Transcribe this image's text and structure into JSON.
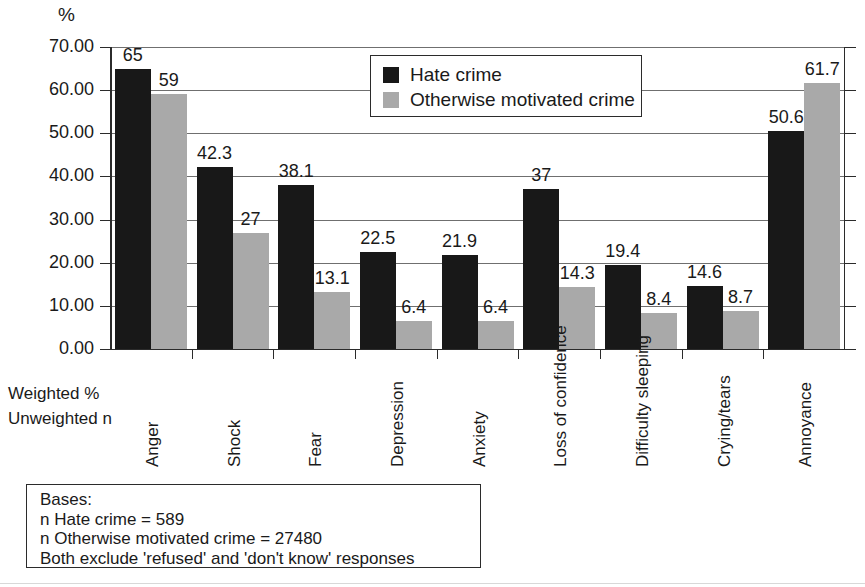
{
  "axis_unit_label": "%",
  "weighted_note": {
    "line1": "Weighted  %",
    "line2": "Unweighted n"
  },
  "legend": {
    "items": [
      {
        "label": "Hate crime",
        "color": "#181818",
        "swatch": "hate"
      },
      {
        "label": "Otherwise motivated crime",
        "color": "#a9a9a9",
        "swatch": "other"
      }
    ]
  },
  "bases": {
    "title": "Bases:",
    "line_hate": "n Hate crime = 589",
    "line_other": "n Otherwise motivated crime = 27480",
    "line_note": "Both exclude 'refused' and 'don't know' responses"
  },
  "chart_data": {
    "type": "bar",
    "title": "",
    "subtitle": "",
    "xlabel": "",
    "ylabel": "%",
    "ylim": [
      0,
      70
    ],
    "ytick_labels": [
      "0.00",
      "10.00",
      "20.00",
      "30.00",
      "40.00",
      "50.00",
      "60.00",
      "70.00"
    ],
    "ytick_values": [
      0,
      10,
      20,
      30,
      40,
      50,
      60,
      70
    ],
    "grid": true,
    "legend_position": "top-center",
    "categories": [
      "Anger",
      "Shock",
      "Fear",
      "Depression",
      "Anxiety",
      "Loss of confidence",
      "Difficulty sleeping",
      "Crying/tears",
      "Annoyance"
    ],
    "series": [
      {
        "name": "Hate crime",
        "color": "#181818",
        "values": [
          65,
          42.3,
          38.1,
          22.5,
          21.9,
          37,
          19.4,
          14.6,
          50.6
        ],
        "labels": [
          "65",
          "42.3",
          "38.1",
          "22.5",
          "21.9",
          "37",
          "19.4",
          "14.6",
          "50.6"
        ]
      },
      {
        "name": "Otherwise motivated crime",
        "color": "#a9a9a9",
        "values": [
          59,
          27,
          13.1,
          6.4,
          6.4,
          14.3,
          8.4,
          8.7,
          61.7
        ],
        "labels": [
          "59",
          "27",
          "13.1",
          "6.4",
          "6.4",
          "14.3",
          "8.4",
          "8.7",
          "61.7"
        ]
      }
    ]
  }
}
